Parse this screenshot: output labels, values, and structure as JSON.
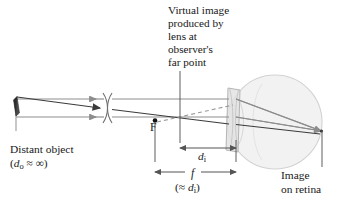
{
  "figure": {
    "kind": "optics-ray-diagram",
    "background": "#ffffff"
  },
  "colors": {
    "ray_gray": "#8d8d8d",
    "ray_dark": "#3b3b3b",
    "eye_fill": "#f1f1f1",
    "eye_stroke": "#cfcfcf",
    "lens_fill": "#e2e2e2",
    "lens_stroke": "#b4b4b4",
    "dim_line": "#555555",
    "text": "#171717",
    "dashed": "#9a9a9a"
  },
  "annotations": {
    "virtual_image_caption": {
      "lines": [
        "Virtual image",
        "produced by",
        "lens at",
        "observer's",
        "far point"
      ],
      "full": "Virtual image produced by lens at observer's far point"
    },
    "distant_object": {
      "title": "Distant object",
      "expression": "(dₒ ≈ ∞)",
      "symbol": "d",
      "subscript": "o",
      "relation": "≈",
      "value": "∞"
    },
    "image_on_retina": {
      "lines": [
        "Image",
        "on retina"
      ],
      "full": "Image on retina"
    },
    "focal_point_label": "F",
    "image_distance": {
      "symbol": "d",
      "subscript": "i",
      "label": "dᵢ"
    },
    "focal_length": {
      "symbol": "f",
      "label": "f",
      "note": "(≈ dᵢ)",
      "note_relation": "≈",
      "note_symbol": "d",
      "note_subscript": "i"
    }
  },
  "elements": {
    "object_arrow": "distant-object-arrow",
    "axis_break": "axis-break-symbol",
    "corrective_lens": "diverging-eyeglass-lens",
    "eyeball": "eyeball-sphere",
    "cornea": "cornea-arc",
    "retina_point": "image-point-on-retina",
    "focal_point": "focal-point-F",
    "dashed_ray": "virtual-image-extension-ray",
    "leader_virtual": "leader-line-virtual-image",
    "leader_retina": "leader-line-retina",
    "dim_di": "dimension-line-di",
    "dim_f": "dimension-line-f"
  }
}
